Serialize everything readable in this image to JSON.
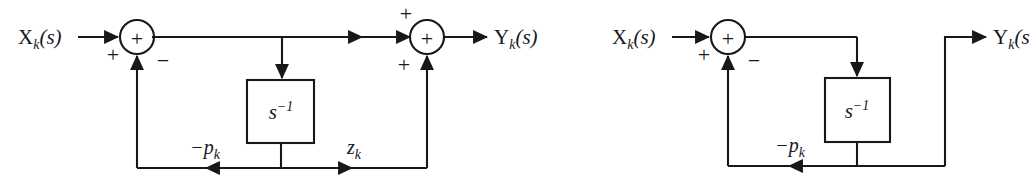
{
  "figure": {
    "background_color": "#ffffff",
    "line_color": "#16181c",
    "text_color": "#16181c",
    "canvas": {
      "width": 1035,
      "height": 185
    }
  },
  "diagrams": [
    {
      "id": "left",
      "name": "pole-zero-section",
      "input_label": {
        "base": "X",
        "sub": "k",
        "args": "(s)"
      },
      "output_label": {
        "base": "Y",
        "sub": "k",
        "args": "(s)"
      },
      "summing_junctions": [
        {
          "name": "input-summing-junction",
          "symbol": "+",
          "input_signs": [
            {
              "position": "left",
              "sign": "+"
            },
            {
              "position": "bottom",
              "sign": "−"
            }
          ]
        },
        {
          "name": "output-summing-junction",
          "symbol": "+",
          "input_signs": [
            {
              "position": "left",
              "sign": "+"
            },
            {
              "position": "bottom",
              "sign": "+"
            }
          ]
        }
      ],
      "blocks": [
        {
          "name": "integrator-block",
          "base": "s",
          "exponent": "−1"
        }
      ],
      "feedback_labels": [
        {
          "name": "pole-gain-label",
          "base": "−p",
          "sub": "k",
          "direction": "left"
        },
        {
          "name": "zero-gain-label",
          "base": "z",
          "sub": "k",
          "direction": "right"
        }
      ]
    },
    {
      "id": "right",
      "name": "pole-only-section",
      "input_label": {
        "base": "X",
        "sub": "k",
        "args": "(s)"
      },
      "output_label": {
        "base": "Y",
        "sub": "k",
        "args": "(s"
      },
      "summing_junctions": [
        {
          "name": "input-summing-junction",
          "symbol": "+",
          "input_signs": [
            {
              "position": "left",
              "sign": "+"
            },
            {
              "position": "bottom",
              "sign": "−"
            }
          ]
        }
      ],
      "blocks": [
        {
          "name": "integrator-block",
          "base": "s",
          "exponent": "−1"
        }
      ],
      "feedback_labels": [
        {
          "name": "pole-gain-label",
          "base": "−p",
          "sub": "k",
          "direction": "left"
        }
      ]
    }
  ]
}
